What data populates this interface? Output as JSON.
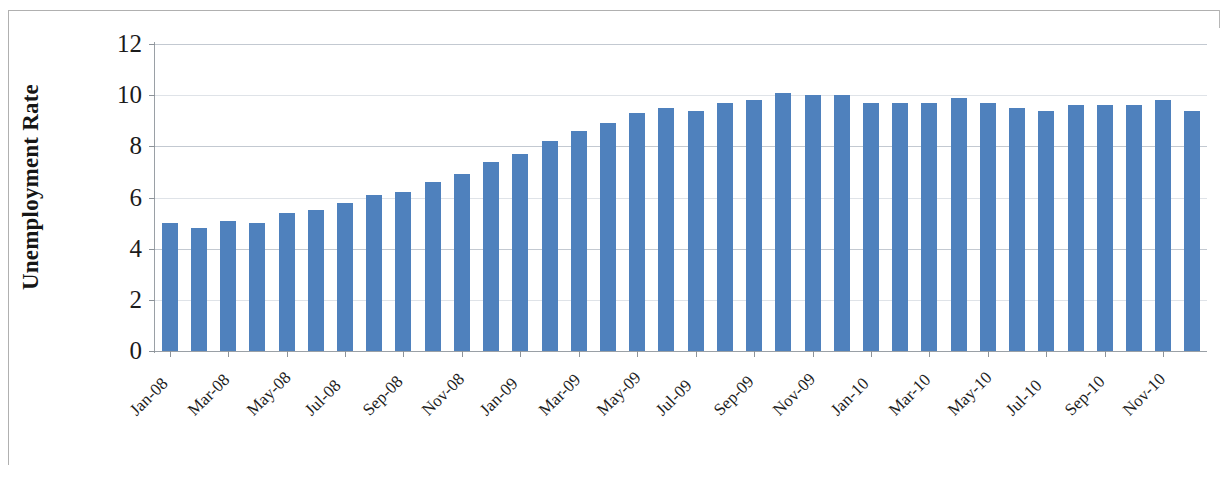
{
  "chart_data": {
    "type": "bar",
    "title": "",
    "xlabel": "",
    "ylabel": "Unemployment Rate",
    "ylim": [
      0,
      12
    ],
    "ytick_values": [
      12,
      10,
      8,
      6,
      4,
      2,
      0
    ],
    "ytick_labels": [
      "12",
      "10",
      "8",
      "6",
      "4",
      "2",
      "0"
    ],
    "grid": true,
    "legend": "none",
    "bar_color": "#4f81bd",
    "categories": [
      "Jan-08",
      "Feb-08",
      "Mar-08",
      "Apr-08",
      "May-08",
      "Jun-08",
      "Jul-08",
      "Aug-08",
      "Sep-08",
      "Oct-08",
      "Nov-08",
      "Dec-08",
      "Jan-09",
      "Feb-09",
      "Mar-09",
      "Apr-09",
      "May-09",
      "Jun-09",
      "Jul-09",
      "Aug-09",
      "Sep-09",
      "Oct-09",
      "Nov-09",
      "Dec-09",
      "Jan-10",
      "Feb-10",
      "Mar-10",
      "Apr-10",
      "May-10",
      "Jun-10",
      "Jul-10",
      "Aug-10",
      "Sep-10",
      "Oct-10",
      "Nov-10",
      "Dec-10"
    ],
    "values": [
      5.0,
      4.8,
      5.1,
      5.0,
      5.4,
      5.5,
      5.8,
      6.1,
      6.2,
      6.6,
      6.9,
      7.4,
      7.7,
      8.2,
      8.6,
      8.9,
      9.3,
      9.5,
      9.4,
      9.7,
      9.8,
      10.1,
      10.0,
      10.0,
      9.7,
      9.7,
      9.7,
      9.9,
      9.7,
      9.5,
      9.4,
      9.6,
      9.6,
      9.6,
      9.8,
      9.4
    ],
    "xtick_labels": [
      "Jan-08",
      "Mar-08",
      "May-08",
      "Jul-08",
      "Sep-08",
      "Nov-08",
      "Jan-09",
      "Mar-09",
      "May-09",
      "Jul-09",
      "Sep-09",
      "Nov-09",
      "Jan-10",
      "Mar-10",
      "May-10",
      "Jul-10",
      "Sep-10",
      "Nov-10"
    ],
    "xtick_indices": [
      0,
      2,
      4,
      6,
      8,
      10,
      12,
      14,
      16,
      18,
      20,
      22,
      24,
      26,
      28,
      30,
      32,
      34
    ]
  }
}
